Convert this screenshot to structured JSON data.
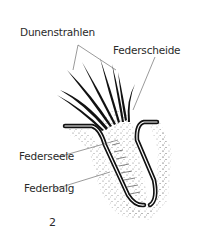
{
  "figure": {
    "number": "2",
    "labels": {
      "dunenstrahlen": "Dunenstrahlen",
      "federscheide": "Federscheide",
      "federseele": "Federseele",
      "federbalg": "Federbalg"
    }
  }
}
